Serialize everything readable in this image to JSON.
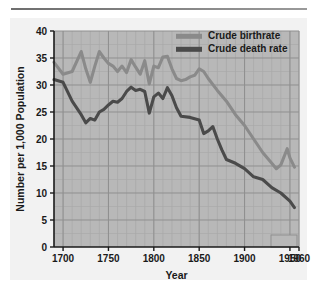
{
  "chart_data": {
    "type": "line",
    "title": "",
    "xlabel": "Year",
    "ylabel": "Number per 1,000 Population",
    "xlim": [
      1690,
      1960
    ],
    "ylim": [
      0,
      40
    ],
    "xticks": [
      "1700",
      "1750",
      "1800",
      "1850",
      "1900",
      "1950",
      "1960"
    ],
    "xtick_values": [
      1700,
      1750,
      1800,
      1850,
      1900,
      1950,
      1960
    ],
    "yticks": [
      "0",
      "5",
      "10",
      "15",
      "20",
      "25",
      "30",
      "35",
      "40"
    ],
    "ytick_values": [
      0,
      5,
      10,
      15,
      20,
      25,
      30,
      35,
      40
    ],
    "grid": true,
    "legend_position": "top-right",
    "series": [
      {
        "name": "Crude birthrate",
        "color": "#8a8a8a",
        "x": [
          1690,
          1700,
          1710,
          1720,
          1725,
          1730,
          1735,
          1740,
          1745,
          1750,
          1755,
          1760,
          1765,
          1770,
          1775,
          1780,
          1785,
          1790,
          1795,
          1800,
          1805,
          1810,
          1815,
          1820,
          1825,
          1830,
          1835,
          1840,
          1845,
          1850,
          1855,
          1860,
          1870,
          1880,
          1890,
          1900,
          1910,
          1920,
          1930,
          1935,
          1940,
          1947,
          1950,
          1955
        ],
        "values": [
          34.2,
          32.0,
          32.5,
          36.2,
          33.0,
          30.5,
          33.5,
          36.2,
          35.0,
          34.0,
          33.5,
          32.5,
          33.5,
          32.3,
          34.7,
          33.3,
          32.0,
          34.5,
          30.2,
          33.5,
          33.2,
          35.2,
          35.3,
          33.0,
          31.2,
          30.8,
          31.0,
          31.5,
          31.8,
          33.0,
          32.5,
          31.2,
          29.0,
          27.0,
          24.5,
          22.5,
          20.0,
          17.5,
          15.5,
          14.5,
          15.2,
          18.2,
          16.5,
          14.8
        ]
      },
      {
        "name": "Crude death rate",
        "color": "#4a4a4a",
        "x": [
          1690,
          1700,
          1710,
          1720,
          1725,
          1730,
          1735,
          1740,
          1745,
          1750,
          1755,
          1760,
          1765,
          1770,
          1775,
          1780,
          1785,
          1790,
          1795,
          1800,
          1805,
          1810,
          1815,
          1820,
          1825,
          1830,
          1840,
          1850,
          1855,
          1860,
          1865,
          1870,
          1875,
          1880,
          1890,
          1900,
          1910,
          1920,
          1930,
          1940,
          1950,
          1955
        ],
        "values": [
          31.0,
          30.5,
          27.0,
          24.5,
          23.0,
          23.8,
          23.5,
          25.0,
          25.5,
          26.3,
          27.0,
          26.8,
          27.5,
          28.8,
          29.6,
          29.0,
          29.2,
          28.8,
          24.8,
          27.8,
          28.5,
          27.5,
          29.5,
          28.0,
          25.8,
          24.2,
          24.0,
          23.5,
          21.0,
          21.5,
          22.3,
          20.0,
          18.0,
          16.2,
          15.5,
          14.5,
          13.0,
          12.5,
          11.0,
          10.0,
          8.5,
          7.3
        ]
      }
    ],
    "legend": [
      {
        "label": "Crude birthrate",
        "color": "#8a8a8a"
      },
      {
        "label": "Crude death rate",
        "color": "#4a4a4a"
      }
    ]
  },
  "style": {
    "plot_background": "#b8b8b8",
    "panel_background": "#f2f2f2",
    "grid_minor": "#a8a8a8",
    "grid_major": "#8f8f8f",
    "axis_color": "#1a1a1a",
    "text_color": "#1a1a1a"
  }
}
